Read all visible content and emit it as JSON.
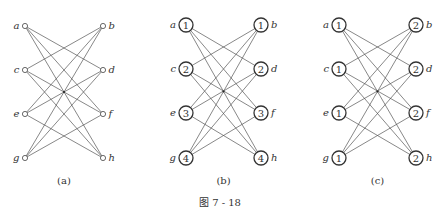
{
  "figure": {
    "caption": "图 7 - 18",
    "colors": {
      "edge": "#555555",
      "node_stroke": "#333333",
      "text": "#333333",
      "background": "#ffffff"
    },
    "graph": {
      "left_nodes": [
        "a",
        "c",
        "e",
        "g"
      ],
      "right_nodes": [
        "b",
        "d",
        "f",
        "h"
      ],
      "edges": [
        [
          "a",
          "d"
        ],
        [
          "a",
          "f"
        ],
        [
          "a",
          "h"
        ],
        [
          "c",
          "b"
        ],
        [
          "c",
          "f"
        ],
        [
          "c",
          "h"
        ],
        [
          "e",
          "b"
        ],
        [
          "e",
          "d"
        ],
        [
          "e",
          "h"
        ],
        [
          "g",
          "b"
        ],
        [
          "g",
          "d"
        ],
        [
          "g",
          "f"
        ]
      ]
    },
    "panels": [
      {
        "id": "a",
        "label": "(a)",
        "node_style": "small",
        "left_x": 25,
        "right_x": 103,
        "rows_y": [
          26,
          70,
          114,
          158
        ],
        "label_y": 184,
        "values": {
          "a": "",
          "b": "",
          "c": "",
          "d": "",
          "e": "",
          "f": "",
          "g": "",
          "h": ""
        }
      },
      {
        "id": "b",
        "label": "(b)",
        "node_style": "big",
        "left_x": 186,
        "right_x": 261,
        "rows_y": [
          25,
          69,
          113,
          158
        ],
        "label_y": 184,
        "values": {
          "a": "1",
          "b": "1",
          "c": "2",
          "d": "2",
          "e": "3",
          "f": "3",
          "g": "4",
          "h": "4"
        }
      },
      {
        "id": "c",
        "label": "(c)",
        "node_style": "big",
        "left_x": 339,
        "right_x": 416,
        "rows_y": [
          25,
          69,
          113,
          158
        ],
        "label_y": 184,
        "values": {
          "a": "1",
          "b": "2",
          "c": "1",
          "d": "2",
          "e": "1",
          "f": "2",
          "g": "1",
          "h": "2"
        }
      }
    ]
  }
}
